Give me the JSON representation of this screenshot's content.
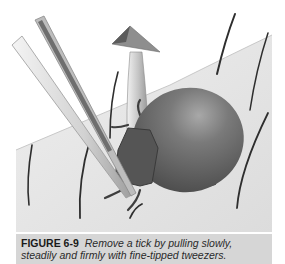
{
  "figure": {
    "label": "FIGURE 6-9",
    "caption": "Remove a tick by pulling slowly, steadily and firmly with fine-tipped tweezers.",
    "illustration": {
      "subjects": [
        "skin-surface",
        "tick",
        "tweezers",
        "upward-arrow",
        "hairs"
      ],
      "colors": {
        "skin": "#e2e2e2",
        "tick_body": "#6e6e6e",
        "tick_head": "#4a4a4a",
        "tweezers": "#cfcfcf",
        "arrow": "#9a9a9a",
        "hair": "#3a3a3a",
        "caption_bg": "#d6d6d6"
      }
    }
  }
}
